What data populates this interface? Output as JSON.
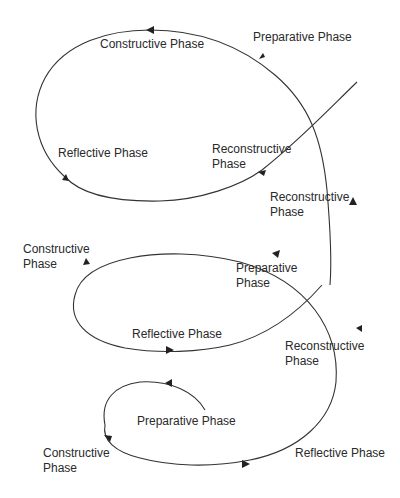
{
  "diagram": {
    "type": "spiral-cycle",
    "stroke_color": "#333333",
    "labels": {
      "top_constructive": "Constructive Phase",
      "top_preparative": "Preparative Phase",
      "top_reflective": "Reflective Phase",
      "top_reconstructive_line1": "Reconstructive",
      "top_reconstructive_line2": "Phase",
      "mid_reconstructive_line1": "Reconstructive",
      "mid_reconstructive_line2": "Phase",
      "mid_constructive_line1": "Constructive",
      "mid_constructive_line2": "Phase",
      "mid_preparative_line1": "Preparative",
      "mid_preparative_line2": "Phase",
      "mid_reflective": "Reflective Phase",
      "low_reconstructive_line1": "Reconstructive",
      "low_reconstructive_line2": "Phase",
      "bottom_preparative": "Preparative Phase",
      "bottom_constructive_line1": "Constructive",
      "bottom_constructive_line2": "Phase",
      "bottom_reflective": "Reflective Phase"
    }
  }
}
